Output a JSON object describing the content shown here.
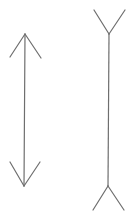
{
  "diagram": {
    "stroke_color": "#6e6e6e",
    "background": "#ffffff",
    "figures": [
      {
        "name": "inward-arrows-line",
        "shaft": {
          "x1": 25,
          "y1": 34,
          "x2": 24,
          "y2": 186
        },
        "top_fins": [
          {
            "x1": 25,
            "y1": 34,
            "x2": 10,
            "y2": 57
          },
          {
            "x1": 25,
            "y1": 34,
            "x2": 41,
            "y2": 58
          }
        ],
        "bottom_fins": [
          {
            "x1": 24,
            "y1": 186,
            "x2": 10,
            "y2": 162
          },
          {
            "x1": 24,
            "y1": 186,
            "x2": 40,
            "y2": 162
          }
        ]
      },
      {
        "name": "outward-fins-line",
        "shaft": {
          "x1": 109,
          "y1": 34,
          "x2": 108,
          "y2": 186
        },
        "top_fins": [
          {
            "x1": 109,
            "y1": 34,
            "x2": 94,
            "y2": 10
          },
          {
            "x1": 109,
            "y1": 34,
            "x2": 125,
            "y2": 10
          }
        ],
        "bottom_fins": [
          {
            "x1": 108,
            "y1": 186,
            "x2": 93,
            "y2": 210
          },
          {
            "x1": 108,
            "y1": 186,
            "x2": 124,
            "y2": 210
          }
        ]
      }
    ]
  }
}
